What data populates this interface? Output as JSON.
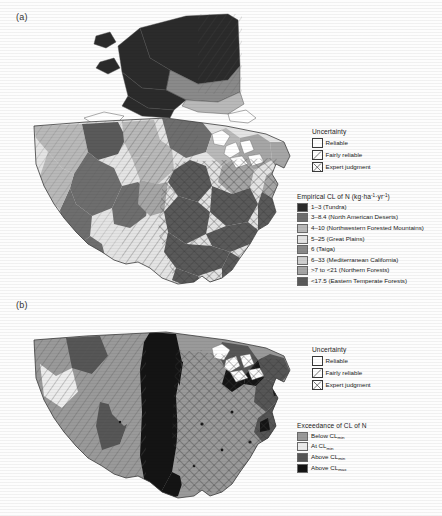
{
  "figure": {
    "panels": [
      {
        "label": "(a)",
        "uncertainty": {
          "title": "Uncertainty",
          "items": [
            {
              "label": "Reliable",
              "pattern": "solid-white"
            },
            {
              "label": "Fairly reliable",
              "pattern": "single-diagonal"
            },
            {
              "label": "Expert judgment",
              "pattern": "cross-hatch"
            }
          ]
        },
        "data_legend": {
          "title_prefix": "Empirical CL of N (kg·ha",
          "title_sup1": "-1",
          "title_mid": "·yr",
          "title_sup2": "-1",
          "title_suffix": ")",
          "title_plain": "Empirical CL of N (kg·ha-1·yr-1)",
          "items": [
            {
              "range": "1–3",
              "region": "(Tundra)",
              "label": "1–3 (Tundra)",
              "color": "#2b2b2b"
            },
            {
              "range": "3–8.4",
              "region": "(North American Deserts)",
              "label": "3–8.4 (North American Deserts)",
              "color": "#6e6e6e"
            },
            {
              "range": "4–10",
              "region": "(Northwestern Forested Mountains)",
              "label": "4–10 (Northwestern Forested Mountains)",
              "color": "#b9b9b9"
            },
            {
              "range": "5–25",
              "region": "(Great Plains)",
              "label": "5–25 (Great Plains)",
              "color": "#e4e4e4"
            },
            {
              "range": "6",
              "region": "(Taiga)",
              "label": "6 (Taiga)",
              "color": "#8a8a8a"
            },
            {
              "range": "6–33",
              "region": "(Mediterranean California)",
              "label": "6–33 (Mediterranean California)",
              "color": "#cfcfcf"
            },
            {
              "range": ">7 to <21",
              "region": "(Northern Forests)",
              "label": ">7 to <21 (Northern Forests)",
              "color": "#a6a6a6"
            },
            {
              "range": "<17.5",
              "region": "(Eastern Temperate Forests)",
              "label": "<17.5 (Eastern Temperate Forests)",
              "color": "#5a5a5a"
            }
          ]
        }
      },
      {
        "label": "(b)",
        "uncertainty": {
          "title": "Uncertainty",
          "items": [
            {
              "label": "Reliable",
              "pattern": "solid-white"
            },
            {
              "label": "Fairly reliable",
              "pattern": "single-diagonal"
            },
            {
              "label": "Expert judgment",
              "pattern": "cross-hatch"
            }
          ]
        },
        "data_legend": {
          "title_plain": "Exceedance of CL of N",
          "title": "Exceedance of CL of N",
          "items": [
            {
              "prefix": "Below CL",
              "sub": "min",
              "label": "Below CLmin",
              "color": "#9a9a9a"
            },
            {
              "prefix": "At CL",
              "sub": "min",
              "label": "At CLmin",
              "color": "#ededed"
            },
            {
              "prefix": "Above CL",
              "sub": "min",
              "label": "Above CLmin",
              "color": "#565656"
            },
            {
              "prefix": "Above CL",
              "sub": "max",
              "label": "Above CLmax",
              "color": "#141414"
            }
          ]
        }
      }
    ]
  }
}
